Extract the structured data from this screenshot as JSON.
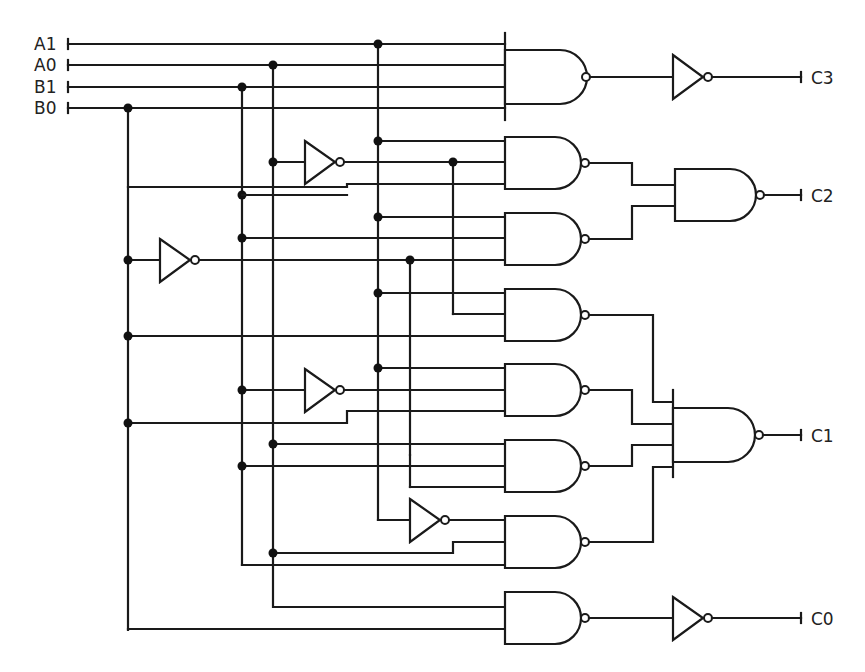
{
  "diagram": {
    "type": "combinational logic circuit (2-bit multiplier using NAND/NOT gates)",
    "inputs": [
      {
        "label": "A1"
      },
      {
        "label": "A0"
      },
      {
        "label": "B1"
      },
      {
        "label": "B0"
      }
    ],
    "outputs": [
      {
        "label": "C3"
      },
      {
        "label": "C2"
      },
      {
        "label": "C1"
      },
      {
        "label": "C0"
      }
    ],
    "gates": {
      "nand_count": 10,
      "not_count": 6
    },
    "colors": {
      "line": "#1a1a1a",
      "background": "#ffffff"
    }
  }
}
